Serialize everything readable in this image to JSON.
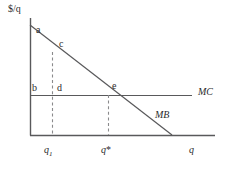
{
  "figure": {
    "type": "economics-diagram",
    "background_color": "#ffffff",
    "line_color": "#59595b",
    "text_color": "#2b2b2b"
  },
  "axes": {
    "y_label": "$/q",
    "x_label": "q",
    "y_axis_x": 30,
    "x_axis_y": 135,
    "x_axis_end": 215,
    "y_axis_top": 18
  },
  "curves": [
    {
      "name": "MB",
      "label": "MB",
      "style": "solid",
      "from": {
        "x": 30,
        "y": 25
      },
      "to": {
        "x": 172,
        "y": 135
      },
      "label_pos": {
        "x": 155,
        "y": 111
      }
    },
    {
      "name": "MC",
      "label": "MC",
      "style": "solid",
      "from": {
        "x": 30,
        "y": 95
      },
      "to": {
        "x": 192,
        "y": 95
      },
      "label_pos": {
        "x": 198,
        "y": 88
      }
    }
  ],
  "dashed_lines": [
    {
      "name": "q1-guide",
      "x": 52,
      "from_y": 52,
      "to_y": 135
    },
    {
      "name": "qstar-guide",
      "x": 108,
      "from_y": 95,
      "to_y": 135
    }
  ],
  "point_labels": [
    {
      "id": "a",
      "text": "a",
      "x": 36,
      "y": 26
    },
    {
      "id": "c",
      "text": "c",
      "x": 59,
      "y": 40
    },
    {
      "id": "b",
      "text": "b",
      "x": 32,
      "y": 84
    },
    {
      "id": "d",
      "text": "d",
      "x": 57,
      "y": 84
    },
    {
      "id": "e",
      "text": "e",
      "x": 112,
      "y": 82
    }
  ],
  "tick_labels": [
    {
      "id": "q1",
      "base": "q",
      "sub": "1",
      "x": 44,
      "y": 145
    },
    {
      "id": "qstar",
      "base": "q",
      "sup": "*",
      "x": 101,
      "y": 145
    }
  ],
  "axis_end_labels": {
    "x": {
      "text": "q",
      "x": 189,
      "y": 145
    },
    "y": {
      "text": "$/q",
      "x": 8,
      "y": 5
    }
  }
}
